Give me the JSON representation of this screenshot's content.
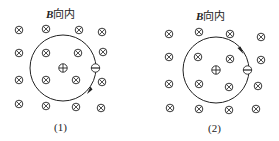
{
  "figures": [
    {
      "title_symbol": "B",
      "title_text": "向内",
      "caption": "(1)",
      "field_symbol": "into-page",
      "circle": {
        "cx": 63,
        "cy": 68,
        "r": 33
      },
      "center_charge": {
        "x": 63,
        "y": 68,
        "sign": "+"
      },
      "orbit_charge": {
        "x": 95,
        "y": 68,
        "sign": "-"
      },
      "arrow": {
        "x": 89,
        "y": 90,
        "direction": "clockwise"
      },
      "field_points": [
        [
          19,
          30
        ],
        [
          46,
          29
        ],
        [
          79,
          30
        ],
        [
          102,
          32
        ],
        [
          19,
          53
        ],
        [
          46,
          53
        ],
        [
          78,
          53
        ],
        [
          103,
          52
        ],
        [
          19,
          80
        ],
        [
          46,
          80
        ],
        [
          76,
          80
        ],
        [
          102,
          82
        ],
        [
          19,
          104
        ],
        [
          46,
          106
        ],
        [
          76,
          107
        ],
        [
          101,
          108
        ]
      ]
    },
    {
      "title_symbol": "B",
      "title_text": "向内",
      "caption": "(2)",
      "field_symbol": "into-page",
      "circle": {
        "cx": 216,
        "cy": 70,
        "r": 33
      },
      "center_charge": {
        "x": 216,
        "y": 70,
        "sign": "+"
      },
      "orbit_charge": {
        "x": 247,
        "y": 70,
        "sign": "-"
      },
      "arrow": {
        "x": 241,
        "y": 49,
        "direction": "clockwise"
      },
      "field_points": [
        [
          169,
          34
        ],
        [
          199,
          32
        ],
        [
          230,
          34
        ],
        [
          261,
          37
        ],
        [
          169,
          57
        ],
        [
          198,
          57
        ],
        [
          230,
          59
        ],
        [
          261,
          60
        ],
        [
          169,
          84
        ],
        [
          199,
          84
        ],
        [
          229,
          87
        ],
        [
          258,
          86
        ],
        [
          170,
          108
        ],
        [
          199,
          109
        ],
        [
          229,
          110
        ],
        [
          256,
          109
        ]
      ]
    }
  ],
  "colors": {
    "stroke": "#222222",
    "background": "#ffffff"
  }
}
